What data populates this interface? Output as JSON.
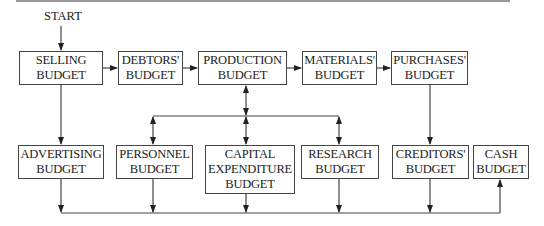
{
  "start_label": "START",
  "boxes": {
    "selling": {
      "line1": "SELLING",
      "line2": "BUDGET"
    },
    "debtors": {
      "line1": "DEBTORS'",
      "line2": "BUDGET"
    },
    "production": {
      "line1": "PRODUCTION",
      "line2": "BUDGET"
    },
    "materials": {
      "line1": "MATERIALS'",
      "line2": "BUDGET"
    },
    "purchases": {
      "line1": "PURCHASES'",
      "line2": "BUDGET"
    },
    "advertising": {
      "line1": "ADVERTISING",
      "line2": "BUDGET"
    },
    "personnel": {
      "line1": "PERSONNEL",
      "line2": "BUDGET"
    },
    "capital": {
      "line1": "CAPITAL",
      "line2": "EXPENDITURE",
      "line3": "BUDGET"
    },
    "research": {
      "line1": "RESEARCH",
      "line2": "BUDGET"
    },
    "creditors": {
      "line1": "CREDITORS'",
      "line2": "BUDGET"
    },
    "cash": {
      "line1": "CASH",
      "line2": "BUDGET"
    }
  },
  "edges": [
    {
      "from": "START",
      "to": "SELLING BUDGET"
    },
    {
      "from": "SELLING BUDGET",
      "to": "DEBTORS' BUDGET"
    },
    {
      "from": "DEBTORS' BUDGET",
      "to": "PRODUCTION BUDGET"
    },
    {
      "from": "PRODUCTION BUDGET",
      "to": "MATERIALS' BUDGET"
    },
    {
      "from": "MATERIALS' BUDGET",
      "to": "PURCHASES' BUDGET"
    },
    {
      "from": "SELLING BUDGET",
      "to": "ADVERTISING BUDGET"
    },
    {
      "from": "PRODUCTION BUDGET",
      "to": "PERSONNEL BUDGET",
      "bidirectional": true
    },
    {
      "from": "PRODUCTION BUDGET",
      "to": "CAPITAL EXPENDITURE BUDGET",
      "bidirectional": true
    },
    {
      "from": "PRODUCTION BUDGET",
      "to": "RESEARCH BUDGET",
      "bidirectional": true
    },
    {
      "from": "PURCHASES' BUDGET",
      "to": "CREDITORS' BUDGET"
    },
    {
      "from": "ADVERTISING BUDGET",
      "to": "CASH BUDGET"
    },
    {
      "from": "PERSONNEL BUDGET",
      "to": "CASH BUDGET"
    },
    {
      "from": "CAPITAL EXPENDITURE BUDGET",
      "to": "CASH BUDGET"
    },
    {
      "from": "RESEARCH BUDGET",
      "to": "CASH BUDGET"
    },
    {
      "from": "CREDITORS' BUDGET",
      "to": "CASH BUDGET"
    }
  ]
}
